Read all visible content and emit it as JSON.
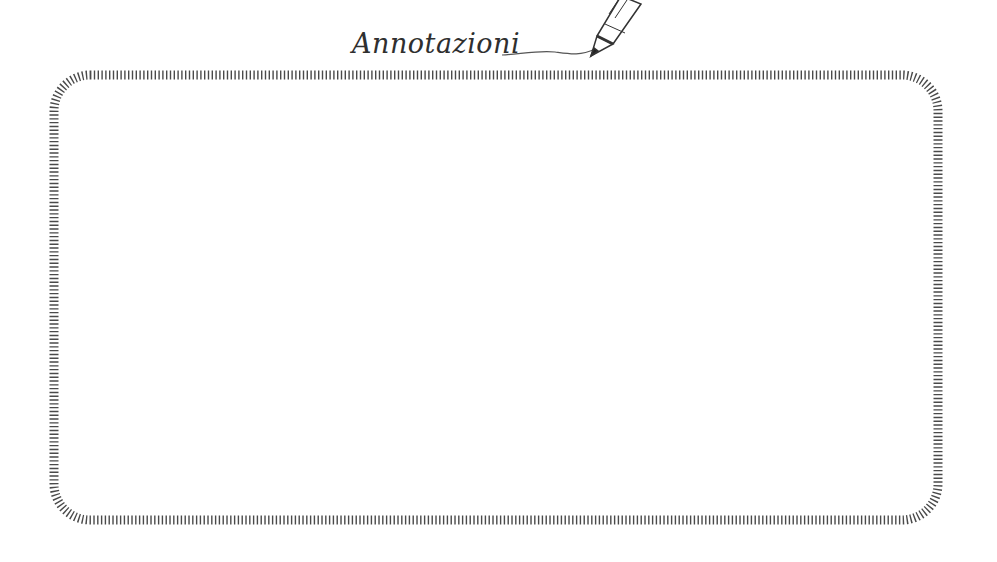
{
  "title": "Annotazioni",
  "icons": {
    "pencil": "pencil-icon"
  },
  "colors": {
    "ink": "#4a4a4a",
    "background": "#ffffff"
  },
  "notes": {
    "content": ""
  }
}
